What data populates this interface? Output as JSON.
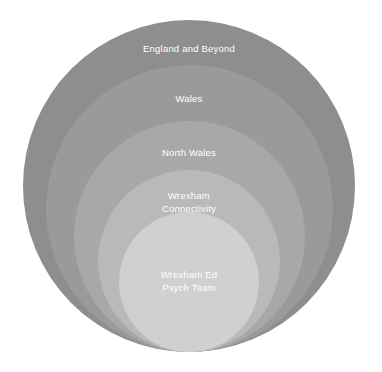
{
  "diagram": {
    "type": "nested-circles",
    "background_color": "#ffffff",
    "label_color": "#ffffff",
    "center_x": 189,
    "bottom_y": 352,
    "rings": [
      {
        "id": "england-and-beyond",
        "label": "England and Beyond",
        "level": 1,
        "color": "#8e8e8e",
        "diameter": 332,
        "top_y": 20,
        "label_y": 42
      },
      {
        "id": "wales",
        "label": "Wales",
        "level": 2,
        "color": "#9a9a9a",
        "diameter": 287,
        "top_y": 65,
        "label_y": 92
      },
      {
        "id": "north-wales",
        "label": "North Wales",
        "level": 3,
        "color": "#a8a8a8",
        "diameter": 231,
        "top_y": 121,
        "label_y": 146
      },
      {
        "id": "wrexham-connectivity",
        "label": "Wrexham\nConnectivity",
        "level": 4,
        "color": "#b9b9b9",
        "diameter": 182,
        "top_y": 170,
        "label_y": 189
      },
      {
        "id": "wrexham-ed-psych-team",
        "label": "Wrexham Ed\nPsych Team",
        "level": 5,
        "color": "#d0d0d0",
        "diameter": 140,
        "top_y": 212,
        "label_y": 268
      }
    ]
  }
}
